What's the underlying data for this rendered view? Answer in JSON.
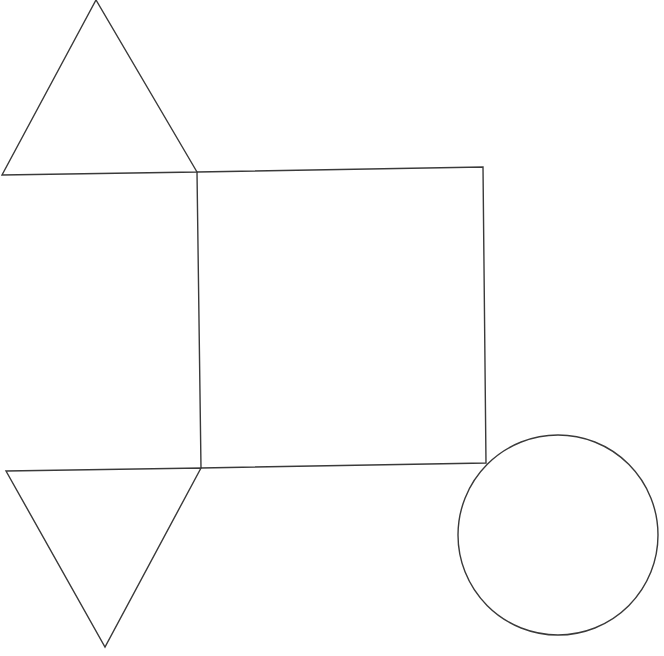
{
  "diagram": {
    "stroke_color": "#3a3a3a",
    "background": "#ffffff",
    "shapes": {
      "top_triangle": {
        "points": "96,0 197,172 2,175"
      },
      "square": {
        "points": "197,172 483,167 486,463 201,468"
      },
      "bottom_triangle": {
        "points": "6,471 201,468 105,647"
      },
      "circle": {
        "cx": 558,
        "cy": 535,
        "r": 100
      }
    }
  }
}
